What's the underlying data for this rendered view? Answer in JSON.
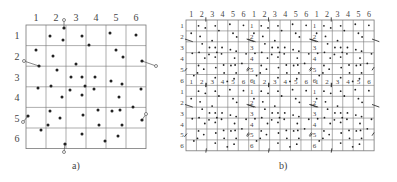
{
  "panel_a": {
    "caption": "a)",
    "col_labels": [
      "1",
      "2",
      "3",
      "4",
      "5",
      "6"
    ],
    "row_labels": [
      "1",
      "2",
      "3",
      "4",
      "5",
      "6"
    ],
    "grid": {
      "x": 26,
      "y": 25,
      "cols": 6,
      "rows": 6,
      "cell_w": 20,
      "cell_h": 20.6
    },
    "points": [
      [
        50,
        36
      ],
      [
        82,
        36
      ],
      [
        110,
        33
      ],
      [
        136,
        35
      ],
      [
        36,
        50
      ],
      [
        53,
        56
      ],
      [
        63,
        40
      ],
      [
        89,
        45
      ],
      [
        116,
        50
      ],
      [
        123,
        57
      ],
      [
        57,
        70
      ],
      [
        76,
        64
      ],
      [
        71,
        77
      ],
      [
        82,
        77
      ],
      [
        95,
        77
      ],
      [
        111,
        81
      ],
      [
        122,
        84
      ],
      [
        38,
        88
      ],
      [
        51,
        86
      ],
      [
        70,
        90
      ],
      [
        85,
        86
      ],
      [
        94,
        89
      ],
      [
        141,
        89
      ],
      [
        62,
        97
      ],
      [
        82,
        95
      ],
      [
        119,
        97
      ],
      [
        50,
        111
      ],
      [
        60,
        118
      ],
      [
        83,
        115
      ],
      [
        98,
        110
      ],
      [
        112,
        111
      ],
      [
        120,
        110
      ],
      [
        133,
        107
      ],
      [
        48,
        125
      ],
      [
        41,
        130
      ],
      [
        99,
        125
      ],
      [
        122,
        125
      ],
      [
        82,
        134
      ],
      [
        105,
        141
      ],
      [
        118,
        136
      ]
    ],
    "boundary_pairs": [
      [
        [
          64,
          28
        ],
        [
          64,
          20
        ]
      ],
      [
        [
          39,
          66
        ],
        [
          24,
          61
        ]
      ],
      [
        [
          142,
          61
        ],
        [
          156,
          66
        ]
      ],
      [
        [
          28,
          116
        ],
        [
          23,
          122
        ]
      ],
      [
        [
          142,
          120
        ],
        [
          146,
          114
        ]
      ],
      [
        [
          65,
          144
        ],
        [
          64,
          152
        ]
      ]
    ]
  },
  "panel_b": {
    "caption": "b)",
    "col_labels": [
      "1",
      "2",
      "3",
      "4",
      "5",
      "6",
      "1",
      "2",
      "3",
      "4",
      "5",
      "6",
      "1",
      "2",
      "3",
      "4",
      "5",
      "6"
    ],
    "row_labels": [
      "1",
      "2",
      "3",
      "4",
      "5",
      "6",
      "1",
      "2",
      "3",
      "4",
      "5",
      "6"
    ],
    "grid": {
      "x": 186,
      "y": 20,
      "cols": 18,
      "rows": 12,
      "cell_w": 10.45,
      "cell_h": 10.9
    }
  },
  "colors": {
    "line": "#777777",
    "dot": "#222222",
    "text": "#444444"
  }
}
